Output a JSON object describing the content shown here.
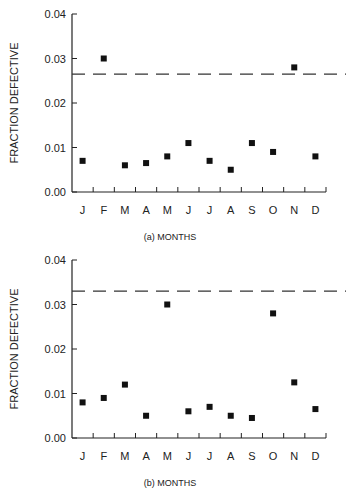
{
  "chart_data": [
    {
      "type": "scatter",
      "title": "",
      "caption": "(a)  MONTHS",
      "xlabel": "",
      "ylabel": "FRACTION DEFECTIVE",
      "ylim": [
        0,
        0.04
      ],
      "yticks": [
        "0.00",
        "0.01",
        "0.02",
        "0.03",
        "0.04"
      ],
      "categories": [
        "J",
        "F",
        "M",
        "A",
        "M",
        "J",
        "J",
        "A",
        "S",
        "O",
        "N",
        "D"
      ],
      "values": [
        0.007,
        0.03,
        0.006,
        0.0065,
        0.008,
        0.011,
        0.007,
        0.005,
        0.011,
        0.009,
        0.028,
        0.008
      ],
      "reference_line": {
        "style": "dashed",
        "value": 0.0265
      },
      "grid": false
    },
    {
      "type": "scatter",
      "title": "",
      "caption": "(b)  MONTHS",
      "xlabel": "",
      "ylabel": "FRACTION DEFECTIVE",
      "ylim": [
        0,
        0.04
      ],
      "yticks": [
        "0.00",
        "0.01",
        "0.02",
        "0.03",
        "0.04"
      ],
      "categories": [
        "J",
        "F",
        "M",
        "A",
        "M",
        "J",
        "J",
        "A",
        "S",
        "O",
        "N",
        "D"
      ],
      "values": [
        0.008,
        0.009,
        0.012,
        0.005,
        0.03,
        0.006,
        0.007,
        0.005,
        0.0045,
        0.028,
        0.0125,
        0.0065
      ],
      "reference_line": {
        "style": "dashed",
        "value": 0.033
      },
      "grid": false
    }
  ]
}
